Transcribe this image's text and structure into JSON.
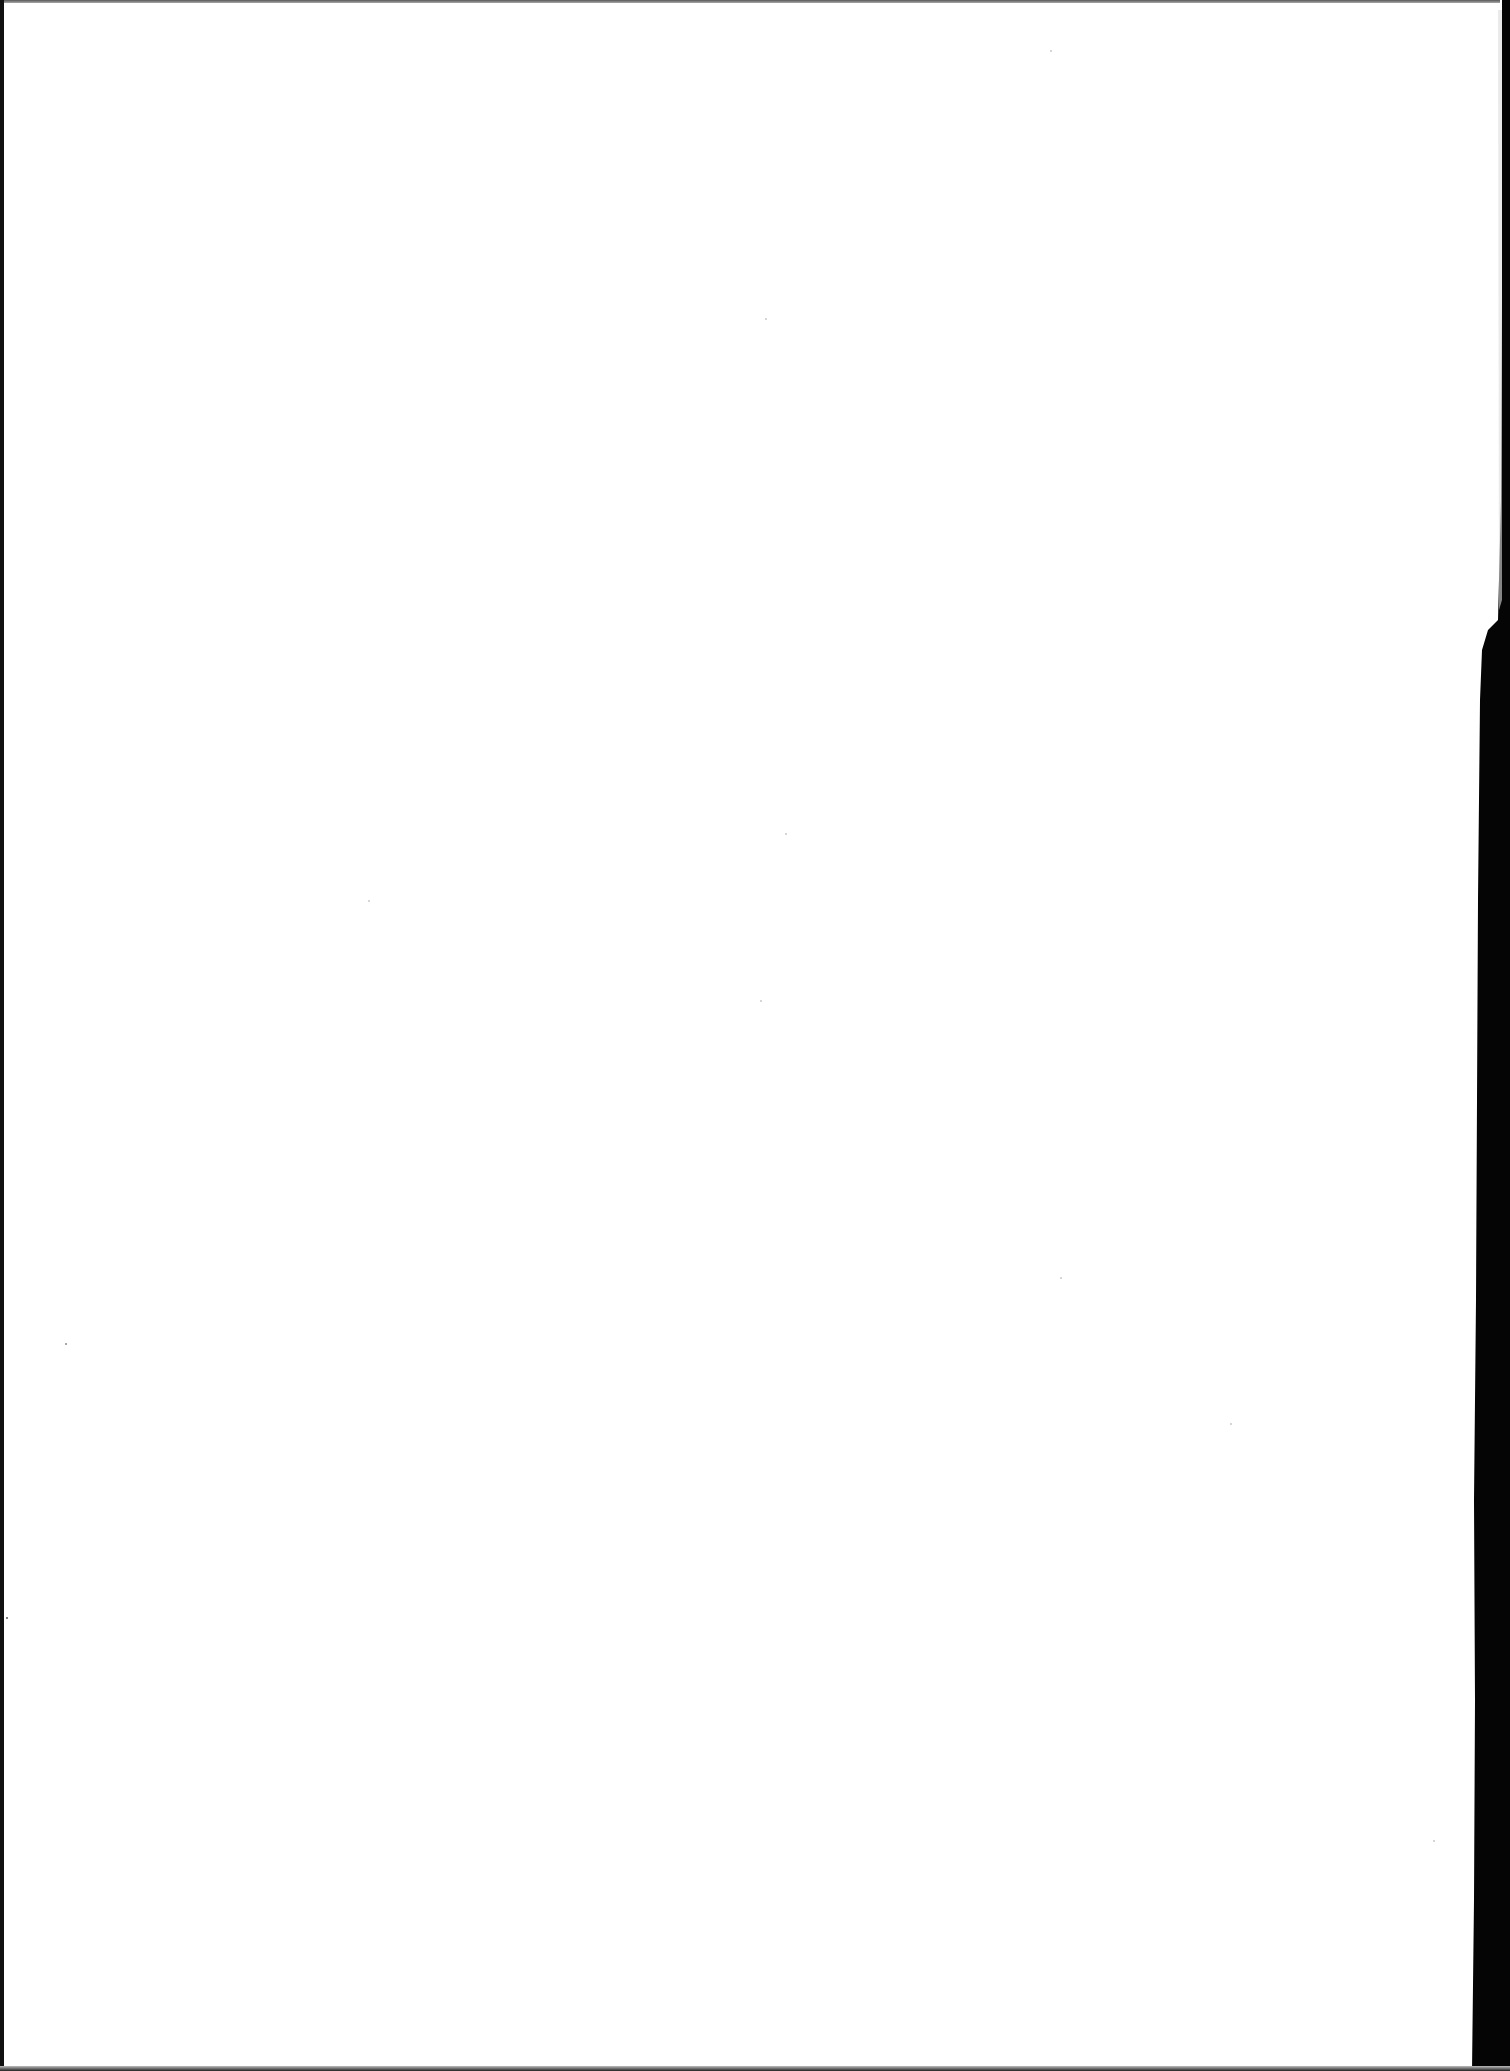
{
  "document": {
    "type": "scanned-page",
    "content": "",
    "background_color": "#ffffff",
    "scan_border_color": "#000000"
  }
}
